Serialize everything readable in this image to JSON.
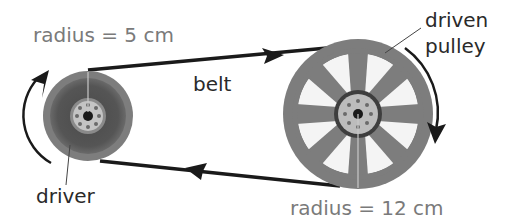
{
  "diagram": {
    "labels": {
      "driver_radius": "radius = 5 cm",
      "belt": "belt",
      "driven_pulley_line1": "driven",
      "driven_pulley_line2": "pulley",
      "driver": "driver",
      "driven_radius": "radius = 12 cm"
    },
    "components": {
      "driver": {
        "name": "driver",
        "radius_cm": 5,
        "rotation": "clockwise"
      },
      "driven": {
        "name": "driven pulley",
        "radius_cm": 12,
        "rotation": "clockwise"
      },
      "belt": {
        "name": "belt",
        "top_direction": "right",
        "bottom_direction": "left"
      }
    },
    "colors": {
      "label_gray": "#7a7a7a",
      "label_dark": "#2a2a2a",
      "belt": "#1a1a1a",
      "pulley_rim": "#7d7d7d",
      "pulley_dark": "#5a5a5a",
      "hub_light": "#b9b9b9"
    }
  }
}
